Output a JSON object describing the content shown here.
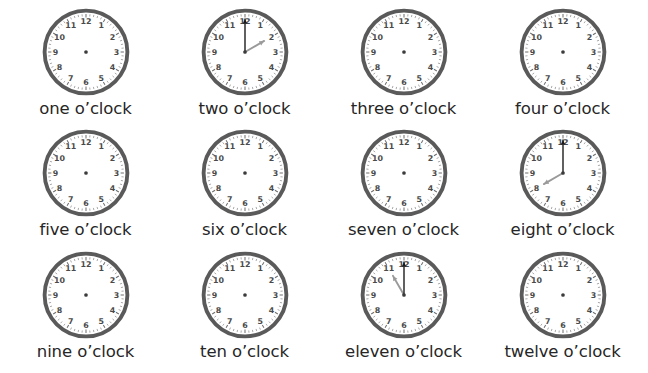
{
  "page": {
    "background_color": "#ffffff",
    "columns": 4,
    "rows": 3
  },
  "style": {
    "rim_color": "#5a5a5a",
    "face_color": "#ffffff",
    "numeral_color": "#4a4a4a",
    "tick_color": "#6e6e6e",
    "center_dot_color": "#3b3b3b",
    "minute_hand_color": "#1a1a1a",
    "hour_hand_color": "#9a9a9a",
    "label_color": "#262626"
  },
  "numerals": [
    "12",
    "1",
    "2",
    "3",
    "4",
    "5",
    "6",
    "7",
    "8",
    "9",
    "10",
    "11"
  ],
  "clocks": [
    {
      "id": "clock-1",
      "label": "one o’clock",
      "hour": 1,
      "minute": 0,
      "hands_visible": false
    },
    {
      "id": "clock-2",
      "label": "two o’clock",
      "hour": 2,
      "minute": 0,
      "hands_visible": true
    },
    {
      "id": "clock-3",
      "label": "three o’clock",
      "hour": 3,
      "minute": 0,
      "hands_visible": false
    },
    {
      "id": "clock-4",
      "label": "four o’clock",
      "hour": 4,
      "minute": 0,
      "hands_visible": false
    },
    {
      "id": "clock-5",
      "label": "five o’clock",
      "hour": 5,
      "minute": 0,
      "hands_visible": false
    },
    {
      "id": "clock-6",
      "label": "six o’clock",
      "hour": 6,
      "minute": 0,
      "hands_visible": false
    },
    {
      "id": "clock-7",
      "label": "seven o’clock",
      "hour": 7,
      "minute": 0,
      "hands_visible": false
    },
    {
      "id": "clock-8",
      "label": "eight o’clock",
      "hour": 8,
      "minute": 0,
      "hands_visible": true
    },
    {
      "id": "clock-9",
      "label": "nine o’clock",
      "hour": 9,
      "minute": 0,
      "hands_visible": false
    },
    {
      "id": "clock-10",
      "label": "ten o’clock",
      "hour": 10,
      "minute": 0,
      "hands_visible": false
    },
    {
      "id": "clock-11",
      "label": "eleven o’clock",
      "hour": 11,
      "minute": 0,
      "hands_visible": true
    },
    {
      "id": "clock-12",
      "label": "twelve o’clock",
      "hour": 12,
      "minute": 0,
      "hands_visible": false
    }
  ]
}
